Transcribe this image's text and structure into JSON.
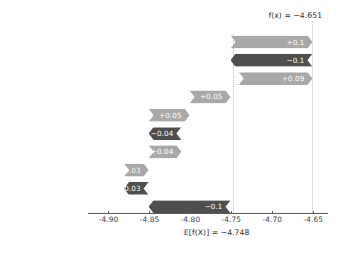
{
  "chart_data": {
    "type": "bar",
    "chart_kind": "shap-waterfall",
    "title": "",
    "xlabel": "",
    "ylabel": "",
    "xlim": [
      -4.925,
      -4.632
    ],
    "xticks": [
      "-4.90",
      "-4.85",
      "-4.80",
      "-4.75",
      "-4.70",
      "-4.65"
    ],
    "xtick_values": [
      -4.9,
      -4.85,
      -4.8,
      -4.75,
      -4.7,
      -4.65
    ],
    "grid": false,
    "legend": "none",
    "base_value": -4.748,
    "base_value_label": "E[f(X)] = −4.748",
    "output_value": -4.651,
    "output_value_label": "f(x) = −4.651",
    "categories": [
      "nhi = nhi",
      "kya = kya",
      "chance = chance",
      "Ap = Ap",
      "kya = kya",
      "kro = kro",
      "mila = mila",
      "ne = ne",
      "ko = ko",
      "20 other features"
    ],
    "values": [
      0.1,
      -0.1,
      0.09,
      0.05,
      0.05,
      -0.04,
      0.04,
      0.03,
      -0.03,
      -0.1
    ],
    "value_labels": [
      "+0.1",
      "−0.1",
      "+0.09",
      "+0.05",
      "+0.05",
      "−0.04",
      "+0.04",
      "+0.03",
      "−0.03",
      "−0.1"
    ],
    "bar_starts": [
      -4.751,
      -4.651,
      -4.741,
      -4.801,
      -4.851,
      -4.811,
      -4.851,
      -4.881,
      -4.851,
      -4.851
    ],
    "bar_ends": [
      -4.651,
      -4.751,
      -4.651,
      -4.751,
      -4.801,
      -4.851,
      -4.811,
      -4.851,
      -4.881,
      -4.751
    ],
    "colors": {
      "positive": "#a8a8a8",
      "negative": "#4f4f4f",
      "positive_text": "#ffffff",
      "negative_text": "#ffffff",
      "axis": "#5a5a5a",
      "tick_text": "#3f3f3f",
      "label_text": "#2e2e2e",
      "dotted_line": "#bdbdbd"
    }
  }
}
